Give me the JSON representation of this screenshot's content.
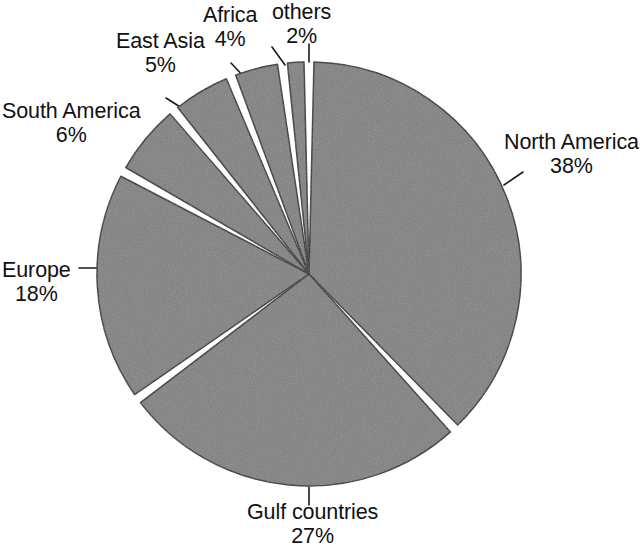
{
  "chart_data": {
    "type": "pie",
    "title": "",
    "subtitle": "",
    "xlabel": "",
    "ylabel": "",
    "legend_position": "none",
    "grid": false,
    "unit": "%",
    "total": 100,
    "categories": [
      "North America",
      "Gulf countries",
      "Europe",
      "South America",
      "East Asia",
      "Africa",
      "others"
    ],
    "values": [
      38,
      27,
      18,
      6,
      5,
      4,
      2
    ],
    "slice_fill_color": "#808080",
    "slice_stroke_color": "#2b2b2b",
    "gap_color": "#ffffff",
    "background_color": "#ffffff",
    "text_color": "#111111",
    "slices": [
      {
        "name": "North America",
        "value": 38,
        "label": "North America",
        "percent_label": "38%",
        "start_deg": 0,
        "end_deg": 136.8
      },
      {
        "name": "Gulf countries",
        "value": 27,
        "label": "Gulf countries",
        "percent_label": "27%",
        "start_deg": 136.8,
        "end_deg": 234.0
      },
      {
        "name": "Europe",
        "value": 18,
        "label": "Europe",
        "percent_label": "18%",
        "start_deg": 234.0,
        "end_deg": 298.8
      },
      {
        "name": "South America",
        "value": 6,
        "label": "South America",
        "percent_label": "6%",
        "start_deg": 298.8,
        "end_deg": 320.4
      },
      {
        "name": "East Asia",
        "value": 5,
        "label": "East Asia",
        "percent_label": "5%",
        "start_deg": 320.4,
        "end_deg": 338.4
      },
      {
        "name": "Africa",
        "value": 4,
        "label": "Africa",
        "percent_label": "4%",
        "start_deg": 338.4,
        "end_deg": 352.8
      },
      {
        "name": "others",
        "value": 2,
        "label": "others",
        "percent_label": "2%",
        "start_deg": 352.8,
        "end_deg": 360.0
      }
    ]
  },
  "labels": {
    "north_america": {
      "name": "North America",
      "percent": "38%"
    },
    "gulf_countries": {
      "name": "Gulf countries",
      "percent": "27%"
    },
    "europe": {
      "name": "Europe",
      "percent": "18%"
    },
    "south_america": {
      "name": "South America",
      "percent": "6%"
    },
    "east_asia": {
      "name": "East Asia",
      "percent": "5%"
    },
    "africa": {
      "name": "Africa",
      "percent": "4%"
    },
    "others": {
      "name": "others",
      "percent": "2%"
    }
  }
}
